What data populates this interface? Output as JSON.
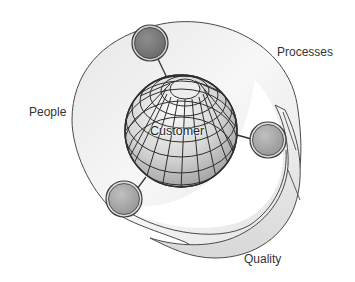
{
  "diagram": {
    "type": "concept-diagram",
    "center": {
      "label": "Customer",
      "shape": "wireframe-globe"
    },
    "ring": {
      "shape": "twisted-ribbon-ellipse"
    },
    "labels": {
      "processes": "Processes",
      "people": "People",
      "quality": "Quality",
      "customer": "Customer"
    },
    "nodes": [
      {
        "id": "node-top",
        "position": "top",
        "shade": "dark"
      },
      {
        "id": "node-right",
        "position": "right",
        "shade": "medium"
      },
      {
        "id": "node-bottom-left",
        "position": "bottom-left",
        "shade": "medium"
      }
    ],
    "colors": {
      "ring_fill": "#ececec",
      "ring_stroke": "#444444",
      "globe_light": "#f4f4f4",
      "globe_dark": "#9a9a9a",
      "node_dark": "#7a7a7a",
      "node_medium": "#a8a8a8",
      "text": "#333333"
    }
  }
}
